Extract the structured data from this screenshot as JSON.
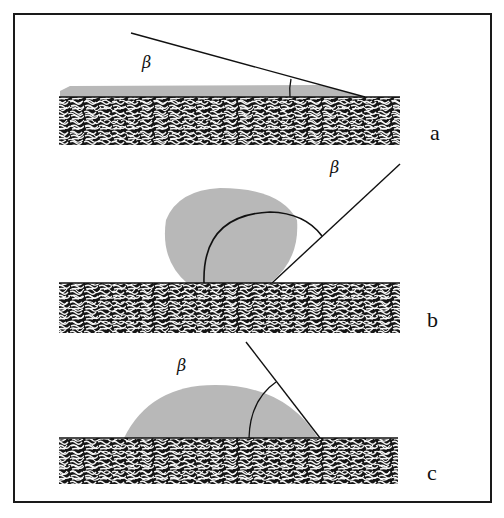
{
  "figure": {
    "colors": {
      "frame": "#1a1a1a",
      "liquid": "#b8b8b8",
      "substrate_dark": "#151515",
      "substrate_light": "#f4f4f4"
    },
    "panels": [
      {
        "id": "a",
        "label": "a",
        "angle_symbol": "β",
        "description": "Spreading film, small contact angle"
      },
      {
        "id": "b",
        "label": "b",
        "angle_symbol": "β",
        "description": "Near-spherical drop, large (obtuse) contact angle"
      },
      {
        "id": "c",
        "label": "c",
        "angle_symbol": "β",
        "description": "Sessile drop, intermediate contact angle"
      }
    ]
  }
}
